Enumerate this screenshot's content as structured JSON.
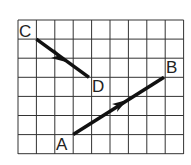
{
  "diagram": {
    "grid": {
      "cols": 9,
      "rows": 7,
      "x0": 18,
      "y0": 20,
      "cell_w": 18.4,
      "cell_h": 19.1
    },
    "vectors": [
      {
        "from": "C",
        "to": "D"
      },
      {
        "from": "A",
        "to": "B"
      }
    ],
    "points": {
      "C": {
        "label": "C",
        "gx": 1,
        "gy": 1
      },
      "D": {
        "label": "D",
        "gx": 4,
        "gy": 3
      },
      "A": {
        "label": "A",
        "gx": 3,
        "gy": 6
      },
      "B": {
        "label": "B",
        "gx": 8,
        "gy": 3
      }
    },
    "colors": {
      "grid": "#333333",
      "vector": "#111111"
    }
  }
}
